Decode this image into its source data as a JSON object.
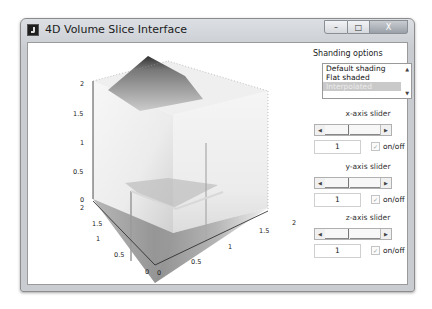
{
  "window": {
    "title": "4D Volume Slice Interface",
    "controls": {
      "minimize": "–",
      "maximize": "□",
      "close": "X"
    }
  },
  "plot": {
    "type": "3d-volume-slice",
    "z_ticks": [
      "0",
      "0.5",
      "1",
      "1.5",
      "2"
    ],
    "y_ticks": [
      "0",
      "0.5",
      "1",
      "1.5",
      "2"
    ],
    "x_ticks": [
      "0",
      "0.5",
      "1",
      "1.5",
      "2"
    ],
    "colormap": "grayscale"
  },
  "panel": {
    "title": "Shanding options",
    "shading_options": [
      "Default shading",
      "Flat shaded",
      "Interpolated"
    ],
    "selected_index": 2,
    "sliders": [
      {
        "label": "x-axis slider",
        "value": "1",
        "checkbox_label": "on/off",
        "checked": true
      },
      {
        "label": "y-axis slider",
        "value": "1",
        "checkbox_label": "on/off",
        "checked": true
      },
      {
        "label": "z-axis slider",
        "value": "1",
        "checkbox_label": "on/off",
        "checked": true
      }
    ],
    "icons": {
      "scroll_up": "▲",
      "scroll_down": "▼",
      "arrow_left": "◀",
      "arrow_right": "▶",
      "check": "✓"
    }
  }
}
